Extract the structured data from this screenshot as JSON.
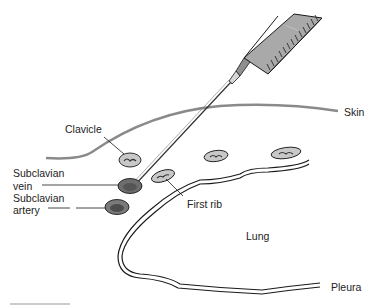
{
  "diagram": {
    "labels": {
      "skin": "Skin",
      "clavicle": "Clavicle",
      "subclavian_vein_line1": "Subclavian",
      "subclavian_vein_line2": "vein",
      "subclavian_artery_line1": "Subclavian",
      "subclavian_artery_line2": "artery",
      "first_rib": "First rib",
      "lung": "Lung",
      "pleura": "Pleura"
    },
    "colors": {
      "line": "#1a1a1a",
      "skin": "#8a8a8a",
      "bone_fill": "#c8c8c8",
      "vessel_fill": "#7a7a7a",
      "syringe_fill": "#a9a9a9",
      "background": "#ffffff"
    }
  }
}
